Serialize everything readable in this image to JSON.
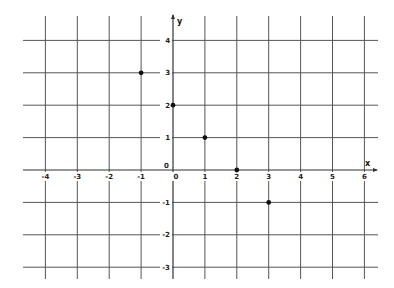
{
  "chart_data": {
    "type": "scatter",
    "title": "",
    "xlabel": "x",
    "ylabel": "y",
    "xlim": [
      -4,
      6
    ],
    "ylim": [
      -3,
      4
    ],
    "grid": true,
    "x_ticks": [
      -4,
      -3,
      -2,
      -1,
      0,
      1,
      2,
      3,
      4,
      5,
      6
    ],
    "y_ticks": [
      -3,
      -2,
      -1,
      1,
      2,
      3,
      4
    ],
    "x_tick_labels": [
      "-4",
      "-3",
      "-2",
      "-1",
      "0",
      "1",
      "2",
      "3",
      "4",
      "5",
      "6"
    ],
    "y_tick_labels": [
      "-3",
      "-2",
      "-1",
      "1",
      "2",
      "3",
      "4"
    ],
    "origin_label": "0",
    "series": [
      {
        "name": "points",
        "points": [
          {
            "x": -1,
            "y": 3
          },
          {
            "x": 0,
            "y": 2
          },
          {
            "x": 1,
            "y": 1
          },
          {
            "x": 2,
            "y": 0
          },
          {
            "x": 3,
            "y": -1
          }
        ]
      }
    ]
  },
  "colors": {
    "background": "#ffffff",
    "grid": "#555555",
    "axis": "#333333",
    "point": "#111111",
    "text": "#222222"
  },
  "layout": {
    "x0_px": 173,
    "y0_px": 170,
    "unit_x_px": 31.9,
    "unit_y_px": 32.4,
    "grid_left_px": 23,
    "grid_right_px": 378,
    "grid_top_px": 14,
    "grid_bottom_px": 279
  }
}
